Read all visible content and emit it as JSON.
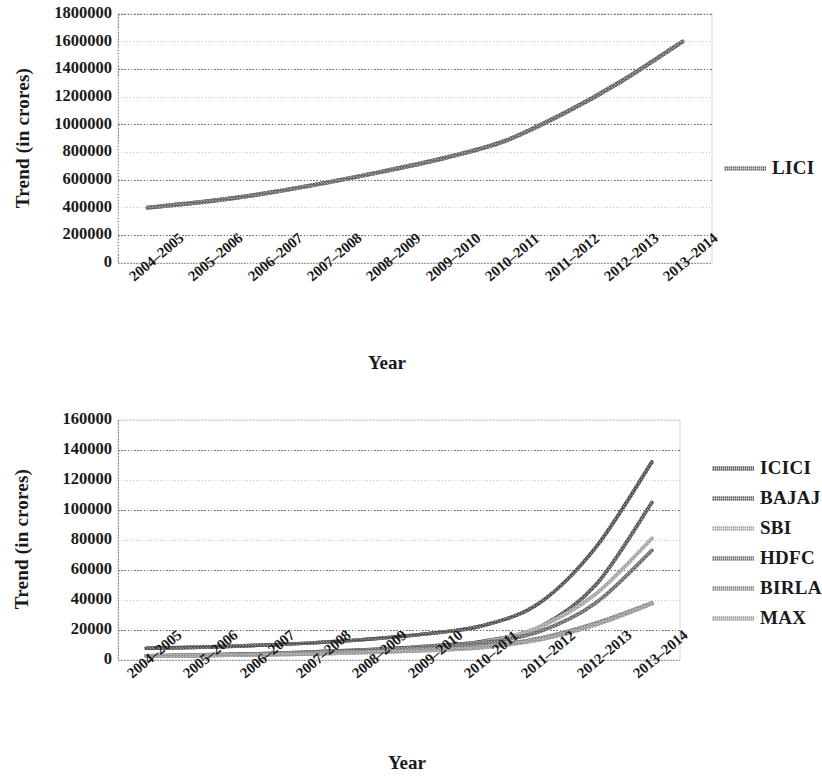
{
  "figures": [
    {
      "id": "lici-trend-chart",
      "ylabel": "Trend (in crores)",
      "xlabel": "Year",
      "legend": [
        {
          "name": "LICI",
          "color": "#6b6b6b"
        }
      ]
    },
    {
      "id": "private-insurers-trend-chart",
      "ylabel": "Trend (in crores)",
      "xlabel": "Year",
      "legend": [
        {
          "name": "ICICI",
          "color": "#565656"
        },
        {
          "name": "BAJAJ",
          "color": "#5e5e5e"
        },
        {
          "name": "SBI",
          "color": "#a8a8a8"
        },
        {
          "name": "HDFC",
          "color": "#707070"
        },
        {
          "name": "BIRLA",
          "color": "#848484"
        },
        {
          "name": "MAX",
          "color": "#9c9c9c"
        }
      ]
    }
  ],
  "chart_data": [
    {
      "type": "line",
      "title": "",
      "xlabel": "Year",
      "ylabel": "Trend (in crores)",
      "categories": [
        "2004–2005",
        "2005–2006",
        "2006–2007",
        "2007–2008",
        "2008–2009",
        "2009–2010",
        "2010–2011",
        "2011–2012",
        "2012–2013",
        "2013–2014"
      ],
      "yticks": [
        0,
        200000,
        400000,
        600000,
        800000,
        1000000,
        1200000,
        1400000,
        1600000,
        1800000
      ],
      "ylim": [
        0,
        1800000
      ],
      "grid": true,
      "legend_position": "right",
      "series": [
        {
          "name": "LICI",
          "color": "#6b6b6b",
          "values": [
            400000,
            445000,
            505000,
            580000,
            665000,
            760000,
            880000,
            1080000,
            1320000,
            1600000
          ]
        }
      ]
    },
    {
      "type": "line",
      "title": "",
      "xlabel": "Year",
      "ylabel": "Trend (in crores)",
      "categories": [
        "2004–2005",
        "2005–2006",
        "2006–2007",
        "2007–2008",
        "2008–2009",
        "2009–2010",
        "2010–2011",
        "2011–2012",
        "2012–2013",
        "2013–2014"
      ],
      "yticks": [
        0,
        20000,
        40000,
        60000,
        80000,
        100000,
        120000,
        140000,
        160000
      ],
      "ylim": [
        0,
        160000
      ],
      "grid": true,
      "legend_position": "right",
      "series": [
        {
          "name": "ICICI",
          "color": "#565656",
          "values": [
            7800,
            8600,
            9800,
            11500,
            14000,
            17500,
            23000,
            38000,
            75000,
            132000
          ]
        },
        {
          "name": "BAJAJ",
          "color": "#5e5e5e",
          "values": [
            2800,
            3400,
            4200,
            5400,
            7000,
            9200,
            12500,
            22000,
            50000,
            105000
          ]
        },
        {
          "name": "SBI",
          "color": "#a8a8a8",
          "values": [
            2600,
            3100,
            3800,
            4800,
            6300,
            8400,
            11800,
            22000,
            44000,
            81000
          ]
        },
        {
          "name": "HDFC",
          "color": "#707070",
          "values": [
            2700,
            3200,
            4000,
            5000,
            6500,
            8500,
            11500,
            19000,
            38000,
            73000
          ]
        },
        {
          "name": "BIRLA",
          "color": "#848484",
          "values": [
            2600,
            3000,
            3600,
            4400,
            5500,
            7000,
            9200,
            14500,
            24500,
            38000
          ]
        },
        {
          "name": "MAX",
          "color": "#9c9c9c",
          "values": [
            2500,
            2900,
            3400,
            4100,
            5100,
            6400,
            8400,
            13500,
            23500,
            37500
          ]
        }
      ]
    }
  ]
}
